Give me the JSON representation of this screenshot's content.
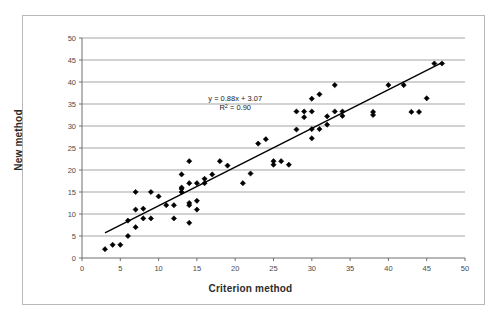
{
  "figure": {
    "background_color": "#ffffff",
    "frame_color": "#b9b9b9"
  },
  "chart_data": {
    "type": "scatter",
    "title": "",
    "subtitle": "",
    "xlabel": "Criterion method",
    "ylabel": "New method",
    "xlim": [
      0,
      50
    ],
    "ylim": [
      0,
      50
    ],
    "xticks": [
      "0",
      "5",
      "10",
      "15",
      "20",
      "25",
      "30",
      "35",
      "40",
      "45",
      "50"
    ],
    "yticks": [
      "0",
      "5",
      "10",
      "15",
      "20",
      "25",
      "30",
      "35",
      "40",
      "45",
      "50"
    ],
    "grid": "horizontal",
    "grid_color": "#808080",
    "legend": "none",
    "marker": {
      "shape": "diamond",
      "color": "#000000",
      "size": 2.6
    },
    "annotations": [
      {
        "name": "regression-equation",
        "text": "y = 0.88x + 3.07",
        "x": 20.0,
        "y": 35.6
      },
      {
        "name": "r-squared",
        "text": "R2 = 0.90",
        "prefix": "R",
        "sup": "2",
        "suffix": " = 0.90",
        "x": 20.0,
        "y": 33.6
      }
    ],
    "trendline": {
      "name": "linear-fit-line",
      "slope": 0.88,
      "intercept": 3.07,
      "r_squared": 0.9,
      "color": "#000000",
      "x_start": 3.0,
      "x_end": 47.0
    },
    "series": [
      {
        "name": "observations",
        "points": [
          [
            3,
            2
          ],
          [
            4,
            3
          ],
          [
            5,
            3
          ],
          [
            6,
            5
          ],
          [
            6,
            8.5
          ],
          [
            7,
            7
          ],
          [
            7,
            11
          ],
          [
            8,
            11.2
          ],
          [
            8,
            9
          ],
          [
            9,
            9
          ],
          [
            9,
            15
          ],
          [
            7,
            15
          ],
          [
            10,
            14
          ],
          [
            11,
            12
          ],
          [
            12,
            12
          ],
          [
            12,
            9
          ],
          [
            13,
            15
          ],
          [
            13,
            15.7
          ],
          [
            13,
            16
          ],
          [
            13,
            19
          ],
          [
            14,
            12
          ],
          [
            14,
            12.5
          ],
          [
            14,
            17
          ],
          [
            14,
            22
          ],
          [
            14,
            8
          ],
          [
            15,
            11
          ],
          [
            15,
            13
          ],
          [
            15,
            17
          ],
          [
            16,
            17
          ],
          [
            16,
            18
          ],
          [
            17,
            19
          ],
          [
            18,
            22
          ],
          [
            19,
            21
          ],
          [
            21,
            17
          ],
          [
            22,
            19.2
          ],
          [
            23,
            26
          ],
          [
            24,
            27
          ],
          [
            25,
            21.2
          ],
          [
            25,
            22
          ],
          [
            26,
            22
          ],
          [
            27,
            21.2
          ],
          [
            28,
            29.2
          ],
          [
            28,
            33.3
          ],
          [
            29,
            33.3
          ],
          [
            29,
            32
          ],
          [
            30,
            27.2
          ],
          [
            30,
            29.3
          ],
          [
            30,
            36.2
          ],
          [
            30,
            33.3
          ],
          [
            31,
            29.3
          ],
          [
            31,
            37.2
          ],
          [
            32,
            30.3
          ],
          [
            32,
            32.2
          ],
          [
            33,
            33.3
          ],
          [
            33,
            39.3
          ],
          [
            34,
            32.3
          ],
          [
            34,
            33.3
          ],
          [
            38,
            32.5
          ],
          [
            38,
            33.2
          ],
          [
            40,
            39.3
          ],
          [
            42,
            39.3
          ],
          [
            43,
            33.2
          ],
          [
            44,
            33.2
          ],
          [
            45,
            36.3
          ],
          [
            46,
            44.2
          ],
          [
            47,
            44.2
          ]
        ]
      }
    ]
  }
}
